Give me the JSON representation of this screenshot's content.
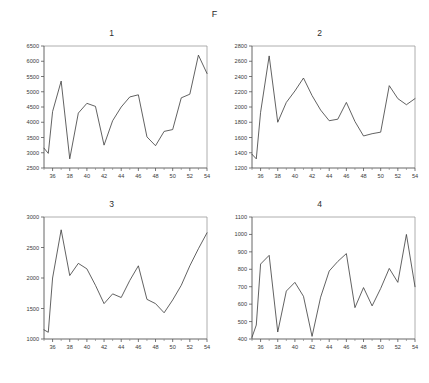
{
  "figure": {
    "group_label": "F",
    "background": "#ffffff",
    "line_color": "#3a3a3a"
  },
  "chart_data": [
    {
      "type": "line",
      "title": "1",
      "xlabel": "",
      "ylabel": "",
      "xlim": [
        35,
        54
      ],
      "ylim": [
        2500,
        6500
      ],
      "yticks": [
        2500,
        3000,
        3500,
        4000,
        4500,
        5000,
        5500,
        6000,
        6500
      ],
      "xticks": [
        36,
        38,
        40,
        42,
        44,
        46,
        48,
        50,
        52,
        54
      ],
      "grid": false,
      "legend": "none",
      "x": [
        35,
        35.5,
        36,
        37,
        38,
        39,
        40,
        41,
        42,
        43,
        44,
        45,
        46,
        47,
        48,
        49,
        50,
        51,
        52,
        53,
        54
      ],
      "values": [
        3150,
        2980,
        4350,
        5350,
        2800,
        4300,
        4620,
        4520,
        3250,
        4050,
        4500,
        4830,
        4900,
        3520,
        3230,
        3700,
        3760,
        4800,
        4920,
        6200,
        5600
      ]
    },
    {
      "type": "line",
      "title": "2",
      "xlabel": "",
      "ylabel": "",
      "xlim": [
        35,
        54
      ],
      "ylim": [
        1200,
        2800
      ],
      "yticks": [
        1200,
        1400,
        1600,
        1800,
        2000,
        2200,
        2400,
        2600,
        2800
      ],
      "xticks": [
        36,
        38,
        40,
        42,
        44,
        46,
        48,
        50,
        52,
        54
      ],
      "grid": false,
      "legend": "none",
      "x": [
        35,
        35.5,
        36,
        37,
        38,
        39,
        40,
        41,
        42,
        43,
        44,
        45,
        46,
        47,
        48,
        49,
        50,
        51,
        52,
        53,
        54
      ],
      "values": [
        1380,
        1320,
        1930,
        2670,
        1800,
        2060,
        2210,
        2380,
        2150,
        1960,
        1820,
        1840,
        2060,
        1810,
        1620,
        1650,
        1670,
        2280,
        2110,
        2030,
        2110
      ]
    },
    {
      "type": "line",
      "title": "3",
      "xlabel": "",
      "ylabel": "",
      "xlim": [
        35,
        54
      ],
      "ylim": [
        1000,
        3000
      ],
      "yticks": [
        1000,
        1500,
        2000,
        2500,
        3000
      ],
      "xticks": [
        36,
        38,
        40,
        42,
        44,
        46,
        48,
        50,
        52,
        54
      ],
      "grid": false,
      "legend": "none",
      "x": [
        35,
        35.5,
        36,
        37,
        38,
        39,
        40,
        41,
        42,
        43,
        44,
        45,
        46,
        47,
        48,
        49,
        50,
        51,
        52,
        53,
        54
      ],
      "values": [
        1150,
        1110,
        2000,
        2790,
        2040,
        2240,
        2150,
        1880,
        1580,
        1740,
        1680,
        1960,
        2200,
        1650,
        1580,
        1430,
        1640,
        1880,
        2200,
        2480,
        2740
      ]
    },
    {
      "type": "line",
      "title": "4",
      "xlabel": "",
      "ylabel": "",
      "xlim": [
        35,
        54
      ],
      "ylim": [
        400,
        1100
      ],
      "yticks": [
        400,
        500,
        600,
        700,
        800,
        900,
        1000,
        1100
      ],
      "xticks": [
        36,
        38,
        40,
        42,
        44,
        46,
        48,
        50,
        52,
        54
      ],
      "grid": false,
      "legend": "none",
      "x": [
        35,
        35.5,
        36,
        37,
        38,
        39,
        40,
        41,
        42,
        43,
        44,
        45,
        46,
        47,
        48,
        49,
        50,
        51,
        52,
        53,
        54
      ],
      "values": [
        410,
        480,
        830,
        880,
        440,
        675,
        725,
        645,
        415,
        640,
        790,
        845,
        890,
        580,
        695,
        590,
        690,
        805,
        725,
        1000,
        700
      ]
    }
  ]
}
